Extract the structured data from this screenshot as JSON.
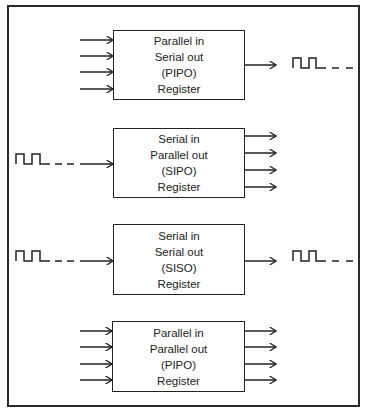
{
  "diagram": {
    "blocks": [
      {
        "id": "piso",
        "lines": [
          "Parallel in",
          "Serial out",
          "(PIPO)",
          "Register"
        ],
        "input": "parallel",
        "input_count": 4,
        "output": "serial",
        "output_count": 1,
        "box": {
          "x": 113,
          "y": 30,
          "w": 132,
          "h": 70
        }
      },
      {
        "id": "sipo",
        "lines": [
          "Serial in",
          "Parallel out",
          "(SIPO)",
          "Register"
        ],
        "input": "serial",
        "input_count": 1,
        "output": "parallel",
        "output_count": 4,
        "box": {
          "x": 113,
          "y": 128,
          "w": 132,
          "h": 70
        }
      },
      {
        "id": "siso",
        "lines": [
          "Serial in",
          "Serial out",
          "(SISO)",
          "Register"
        ],
        "input": "serial",
        "input_count": 1,
        "output": "serial",
        "output_count": 1,
        "box": {
          "x": 113,
          "y": 224,
          "w": 132,
          "h": 71
        }
      },
      {
        "id": "pipo",
        "lines": [
          "Parallel in",
          "Parallel out",
          "(PIPO)",
          "Register"
        ],
        "input": "parallel",
        "input_count": 4,
        "output": "parallel",
        "output_count": 4,
        "box": {
          "x": 112,
          "y": 321,
          "w": 133,
          "h": 71
        }
      }
    ],
    "signals": {
      "serial_waveform": "pulse-train",
      "line_color": "#222222"
    }
  }
}
